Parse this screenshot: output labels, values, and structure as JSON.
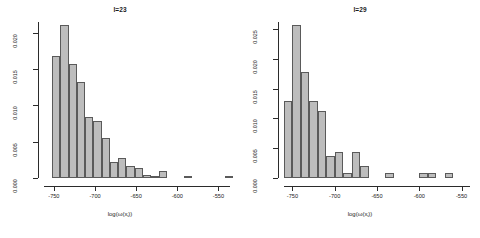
{
  "figure": {
    "background": "#ffffff",
    "bar_fill": "#bdbdbd",
    "bar_stroke": "#5a5a5a",
    "axis_color": "#2b2b2b"
  },
  "panels": [
    {
      "id": "left",
      "title": "l=23",
      "xlabel_main": "log(ω(x",
      "xlabel_sub": "i",
      "xlabel_tail": "))",
      "xticks": [
        "-750",
        "-700",
        "-650",
        "-600",
        "-550"
      ],
      "yticks": [
        "0.000",
        "0.005",
        "0.010",
        "0.015",
        "0.020"
      ]
    },
    {
      "id": "right",
      "title": "l=29",
      "xlabel_main": "log(ω(x",
      "xlabel_sub": "i",
      "xlabel_tail": "))",
      "xticks": [
        "-750",
        "-700",
        "-650",
        "-600",
        "-550"
      ],
      "yticks": [
        "0.000",
        "0.005",
        "0.010",
        "0.015",
        "0.020",
        "0.025"
      ]
    }
  ],
  "chart_data": [
    {
      "type": "bar",
      "id": "hist-l23",
      "title": "l=23",
      "xlabel": "log(w(x_i))",
      "ylabel": "",
      "grid": false,
      "legend": null,
      "xlim": [
        -762,
        -536
      ],
      "ylim": [
        0.0,
        0.0215
      ],
      "bin_width": 10,
      "bin_starts": [
        -762,
        -752,
        -742,
        -732,
        -722,
        -712,
        -702,
        -692,
        -682,
        -672,
        -662,
        -652,
        -642,
        -632,
        -622,
        -612,
        -602,
        -592,
        -582,
        -572,
        -562,
        -552,
        -542
      ],
      "bin_centers": [
        -757,
        -747,
        -737,
        -727,
        -717,
        -707,
        -697,
        -687,
        -677,
        -667,
        -657,
        -647,
        -637,
        -627,
        -617,
        -607,
        -597,
        -587,
        -577,
        -567,
        -557,
        -547,
        -537
      ],
      "values": [
        0.0,
        0.0168,
        0.0211,
        0.0157,
        0.0133,
        0.0084,
        0.0079,
        0.0055,
        0.0022,
        0.0027,
        0.0017,
        0.0014,
        0.0004,
        0.0002,
        0.0009,
        0.0,
        0.0,
        0.0002,
        0.0,
        0.0,
        0.0,
        0.0,
        0.0002
      ],
      "xticks": [
        -750,
        -700,
        -650,
        -600,
        -550
      ],
      "yticks": [
        0.0,
        0.005,
        0.01,
        0.015,
        0.02
      ],
      "ytick_labels": [
        "0.000",
        "0.005",
        "0.010",
        "0.015",
        "0.020"
      ],
      "xtick_labels": [
        "-750",
        "-700",
        "-650",
        "-600",
        "-550"
      ]
    },
    {
      "type": "bar",
      "id": "hist-l29",
      "title": "l=29",
      "xlabel": "log(w(x_i))",
      "ylabel": "",
      "grid": false,
      "legend": null,
      "xlim": [
        -760,
        -540
      ],
      "ylim": [
        0.0,
        0.0262
      ],
      "bin_width": 10,
      "bin_starts": [
        -760,
        -750,
        -740,
        -730,
        -720,
        -710,
        -700,
        -690,
        -680,
        -670,
        -660,
        -650,
        -640,
        -630,
        -620,
        -610,
        -600,
        -590,
        -580,
        -570,
        -560,
        -550
      ],
      "bin_centers": [
        -755,
        -745,
        -735,
        -725,
        -715,
        -705,
        -695,
        -685,
        -675,
        -665,
        -655,
        -645,
        -635,
        -625,
        -615,
        -605,
        -595,
        -585,
        -575,
        -565,
        -555,
        -545
      ],
      "values": [
        0.013,
        0.0257,
        0.0178,
        0.013,
        0.0113,
        0.0037,
        0.0044,
        0.0009,
        0.0044,
        0.0021,
        0.0,
        0.0,
        0.0009,
        0.0,
        0.0,
        0.0,
        0.0009,
        0.0009,
        0.0,
        0.0009,
        0.0,
        0.0
      ],
      "xticks": [
        -750,
        -700,
        -650,
        -600,
        -550
      ],
      "yticks": [
        0.0,
        0.005,
        0.01,
        0.015,
        0.02,
        0.025
      ],
      "ytick_labels": [
        "0.000",
        "0.005",
        "0.010",
        "0.015",
        "0.020",
        "0.025"
      ],
      "xtick_labels": [
        "-750",
        "-700",
        "-650",
        "-600",
        "-550"
      ]
    }
  ]
}
